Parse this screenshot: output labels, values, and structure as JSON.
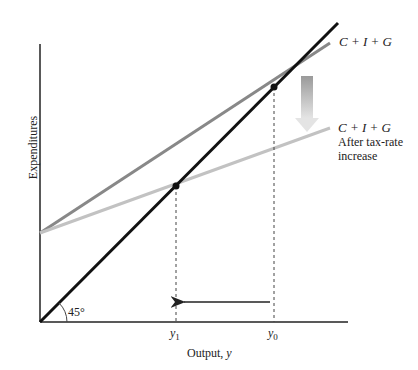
{
  "diagram": {
    "type": "Keynesian cross",
    "y_axis_label": "Expenditures",
    "x_axis_label": "Output, ",
    "x_axis_var": "y",
    "angle_label": "45°",
    "ticks": {
      "y1": "y",
      "y1_sub": "1",
      "y0": "y",
      "y0_sub": "0"
    },
    "lines": [
      {
        "name": "45-degree line",
        "color": "#111111"
      },
      {
        "name": "C + I + G",
        "label": "C + I + G",
        "color": "#888888"
      },
      {
        "name": "C + I + G after tax-rate increase",
        "label": "C + I + G",
        "label2": "After tax-rate",
        "label3": "increase",
        "color": "#c2c2c2"
      }
    ],
    "equilibria": [
      {
        "name": "y0",
        "x": 274,
        "y": 87
      },
      {
        "name": "y1",
        "x": 176,
        "y": 186
      }
    ]
  }
}
